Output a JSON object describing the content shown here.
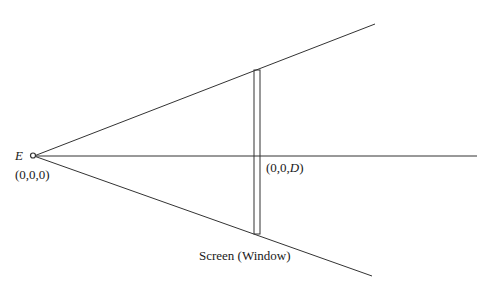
{
  "diagram": {
    "eye": {
      "label": "E",
      "coords": "(0,0,0)"
    },
    "screen_center": {
      "coords_prefix": "(0,0,",
      "coords_var": "D",
      "coords_suffix": ")"
    },
    "screen": {
      "label": "Screen (Window)"
    },
    "colors": {
      "line": "#333333",
      "text": "#1a1a1a",
      "background": "#ffffff"
    }
  }
}
